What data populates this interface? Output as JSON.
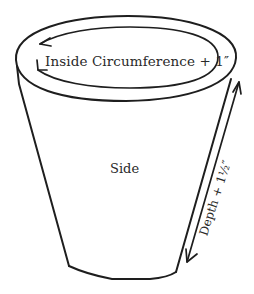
{
  "diagram": {
    "labels": {
      "circumference": "Inside Circumference + 1″",
      "side": "Side",
      "depth": "Depth + 1½″"
    },
    "colors": {
      "line": "#1e1e1e",
      "text": "#2a2a2a",
      "background": "#ffffff"
    },
    "shapes": {
      "outer_rim": "ellipse",
      "inner_rim_arrow": "circular arrow around inside circumference",
      "side_panel": "tapered pot side",
      "depth_arrow": "double-headed arrow along right side"
    }
  }
}
